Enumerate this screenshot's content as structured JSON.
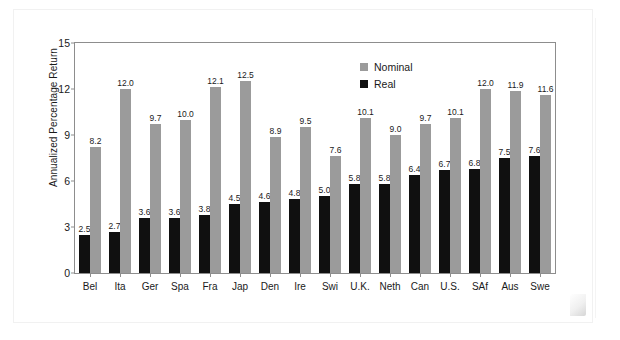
{
  "chart_data": {
    "type": "bar",
    "title": "",
    "xlabel": "",
    "ylabel": "Annualized Percentage Return",
    "ylim": [
      0,
      15
    ],
    "yticks": [
      0,
      3,
      6,
      9,
      12,
      15
    ],
    "grid": false,
    "legend_position": "top-right",
    "categories": [
      "Bel",
      "Ita",
      "Ger",
      "Spa",
      "Fra",
      "Jap",
      "Den",
      "Ire",
      "Swi",
      "U.K.",
      "Neth",
      "Can",
      "U.S.",
      "SAf",
      "Aus",
      "Swe"
    ],
    "series": [
      {
        "name": "Real",
        "color": "#101010",
        "values": [
          2.5,
          2.7,
          3.6,
          3.6,
          3.8,
          4.5,
          4.6,
          4.8,
          5.0,
          5.8,
          5.8,
          6.4,
          6.7,
          6.8,
          7.5,
          7.6
        ],
        "labels": [
          "2.5",
          "2.7",
          "3.6",
          "3.6",
          "3.8",
          "4.5",
          "4.6",
          "4.8",
          "5.0",
          "5.8",
          "5.8",
          "6.4",
          "6.7",
          "6.8",
          "7.5",
          "7.6"
        ]
      },
      {
        "name": "Nominal",
        "color": "#9b9b9b",
        "values": [
          8.2,
          12.0,
          9.7,
          10.0,
          12.1,
          12.5,
          8.9,
          9.5,
          7.6,
          10.1,
          9.0,
          9.7,
          10.1,
          12.0,
          11.9,
          11.6
        ],
        "labels": [
          "8.2",
          "12.0",
          "9.7",
          "10.0",
          "12.1",
          "12.5",
          "8.9",
          "9.5",
          "7.6",
          "10.1",
          "9.0",
          "9.7",
          "10.1",
          "12.0",
          "11.9",
          "11.6"
        ]
      }
    ],
    "legend": [
      {
        "label": "Nominal",
        "color": "#9b9b9b"
      },
      {
        "label": "Real",
        "color": "#101010"
      }
    ]
  }
}
